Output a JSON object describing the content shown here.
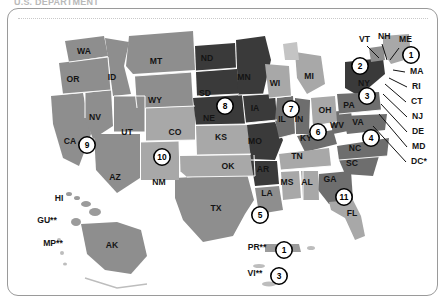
{
  "header": {
    "clipped_title": "U.S. DEPARTMENT"
  },
  "frame": {
    "has_dotted_rule": true
  },
  "map": {
    "title": "United States choropleth map with numbered region markers",
    "colors": {
      "shade_darkest": "#3a3a3a",
      "shade_dark": "#6e6e6e",
      "shade_mid": "#8e8e8e",
      "shade_light": "#a8a8a8",
      "shade_lightest": "#c4c4c4",
      "border": "#ffffff",
      "marker_fill": "#ffffff",
      "marker_stroke": "#000000",
      "label_color": "#141414"
    },
    "state_labels": [
      {
        "abbr": "WA",
        "x": 77,
        "y": 46,
        "shade": "shade_mid"
      },
      {
        "abbr": "OR",
        "x": 66,
        "y": 74,
        "shade": "shade_mid"
      },
      {
        "abbr": "ID",
        "x": 105,
        "y": 72,
        "shade": "shade_mid"
      },
      {
        "abbr": "MT",
        "x": 149,
        "y": 56,
        "shade": "shade_mid"
      },
      {
        "abbr": "WY",
        "x": 148,
        "y": 95,
        "shade": "shade_light"
      },
      {
        "abbr": "NV",
        "x": 88,
        "y": 112,
        "shade": "shade_mid"
      },
      {
        "abbr": "UT",
        "x": 120,
        "y": 127,
        "shade": "shade_mid"
      },
      {
        "abbr": "CA",
        "x": 63,
        "y": 136,
        "shade": "shade_mid"
      },
      {
        "abbr": "AZ",
        "x": 108,
        "y": 172,
        "shade": "shade_mid"
      },
      {
        "abbr": "NM",
        "x": 152,
        "y": 177,
        "shade": "shade_light"
      },
      {
        "abbr": "CO",
        "x": 168,
        "y": 127,
        "shade": "shade_light"
      },
      {
        "abbr": "ND",
        "x": 200,
        "y": 53,
        "shade": "shade_darkest"
      },
      {
        "abbr": "SD",
        "x": 198,
        "y": 88,
        "shade": "shade_darkest"
      },
      {
        "abbr": "NE",
        "x": 202,
        "y": 113,
        "shade": "shade_darkest"
      },
      {
        "abbr": "KS",
        "x": 214,
        "y": 132,
        "shade": "shade_light"
      },
      {
        "abbr": "OK",
        "x": 221,
        "y": 161,
        "shade": "shade_light"
      },
      {
        "abbr": "TX",
        "x": 209,
        "y": 203,
        "shade": "shade_mid"
      },
      {
        "abbr": "MN",
        "x": 237,
        "y": 72,
        "shade": "shade_darkest"
      },
      {
        "abbr": "IA",
        "x": 248,
        "y": 103,
        "shade": "shade_darkest"
      },
      {
        "abbr": "MO",
        "x": 248,
        "y": 136,
        "shade": "shade_darkest"
      },
      {
        "abbr": "AR",
        "x": 256,
        "y": 164,
        "shade": "shade_darkest"
      },
      {
        "abbr": "LA",
        "x": 260,
        "y": 188,
        "shade": "shade_mid"
      },
      {
        "abbr": "WI",
        "x": 268,
        "y": 78,
        "shade": "shade_light"
      },
      {
        "abbr": "IL",
        "x": 275,
        "y": 114,
        "shade": "shade_dark"
      },
      {
        "abbr": "IN",
        "x": 292,
        "y": 114,
        "shade": "shade_dark"
      },
      {
        "abbr": "MI",
        "x": 302,
        "y": 71,
        "shade": "shade_light"
      },
      {
        "abbr": "OH",
        "x": 318,
        "y": 105,
        "shade": "shade_light"
      },
      {
        "abbr": "KY",
        "x": 299,
        "y": 133,
        "shade": "shade_dark"
      },
      {
        "abbr": "TN",
        "x": 290,
        "y": 151,
        "shade": "shade_light"
      },
      {
        "abbr": "MS",
        "x": 280,
        "y": 177,
        "shade": "shade_light"
      },
      {
        "abbr": "AL",
        "x": 300,
        "y": 177,
        "shade": "shade_light"
      },
      {
        "abbr": "GA",
        "x": 323,
        "y": 174,
        "shade": "shade_dark"
      },
      {
        "abbr": "FL",
        "x": 345,
        "y": 208,
        "shade": "shade_light"
      },
      {
        "abbr": "SC",
        "x": 345,
        "y": 158,
        "shade": "shade_dark"
      },
      {
        "abbr": "NC",
        "x": 348,
        "y": 143,
        "shade": "shade_dark"
      },
      {
        "abbr": "WV",
        "x": 330,
        "y": 120,
        "shade": "shade_dark"
      },
      {
        "abbr": "VA",
        "x": 351,
        "y": 117,
        "shade": "shade_dark"
      },
      {
        "abbr": "PA",
        "x": 342,
        "y": 100,
        "shade": "shade_dark"
      },
      {
        "abbr": "NY",
        "x": 357,
        "y": 78,
        "shade": "shade_darkest"
      }
    ],
    "callout_labels": [
      {
        "abbr": "VT",
        "x": 352,
        "y": 34
      },
      {
        "abbr": "NH",
        "x": 371,
        "y": 31
      },
      {
        "abbr": "ME",
        "x": 392,
        "y": 34
      },
      {
        "abbr": "MA",
        "x": 403,
        "y": 66
      },
      {
        "abbr": "RI",
        "x": 405,
        "y": 81
      },
      {
        "abbr": "CT",
        "x": 404,
        "y": 96
      },
      {
        "abbr": "NJ",
        "x": 405,
        "y": 111
      },
      {
        "abbr": "DE",
        "x": 405,
        "y": 126
      },
      {
        "abbr": "MD",
        "x": 405,
        "y": 141
      },
      {
        "abbr": "DC*",
        "x": 404,
        "y": 156
      }
    ],
    "territory_labels": [
      {
        "abbr": "HI",
        "x": 52,
        "y": 193
      },
      {
        "abbr": "GU**",
        "x": 40,
        "y": 215
      },
      {
        "abbr": "MP**",
        "x": 46,
        "y": 238
      },
      {
        "abbr": "AK",
        "x": 105,
        "y": 240
      },
      {
        "abbr": "PR**",
        "x": 250,
        "y": 242
      },
      {
        "abbr": "VI**",
        "x": 248,
        "y": 268
      }
    ],
    "markers": [
      {
        "number": "1",
        "x": 404,
        "y": 47,
        "region": "Maine / HHS Region 1"
      },
      {
        "number": "2",
        "x": 353,
        "y": 58,
        "region": "New York / HHS Region 2"
      },
      {
        "number": "3",
        "x": 360,
        "y": 88,
        "region": "Pennsylvania / HHS Region 3"
      },
      {
        "number": "4",
        "x": 364,
        "y": 130,
        "region": "Southeast / HHS Region 4"
      },
      {
        "number": "5",
        "x": 253,
        "y": 207,
        "region": "Gulf Coast / HHS Region 6"
      },
      {
        "number": "6",
        "x": 311,
        "y": 124,
        "region": "Ohio Valley / HHS Region 5"
      },
      {
        "number": "7",
        "x": 284,
        "y": 101,
        "region": "Illinois / Midwest"
      },
      {
        "number": "8",
        "x": 218,
        "y": 98,
        "region": "Great Plains"
      },
      {
        "number": "9",
        "x": 80,
        "y": 137,
        "region": "California / Pacific"
      },
      {
        "number": "10",
        "x": 155,
        "y": 149,
        "region": "Mountain / Colorado"
      },
      {
        "number": "11",
        "x": 337,
        "y": 189,
        "region": "Georgia / Southeast"
      },
      {
        "number": "1",
        "x": 277,
        "y": 242,
        "region": "Puerto Rico"
      },
      {
        "number": "3",
        "x": 272,
        "y": 268,
        "region": "U.S. Virgin Islands"
      }
    ],
    "footnotes": [
      "*",
      "**"
    ]
  }
}
